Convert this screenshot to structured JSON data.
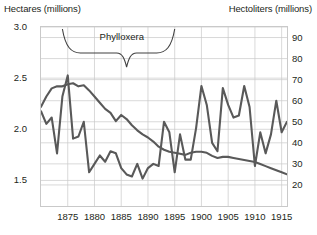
{
  "axis_titles": {
    "left": "Hectares (millions)",
    "right": "Hectoliters (millions)"
  },
  "annotation": {
    "label": "Phylloxera"
  },
  "colors": {
    "line": "#595959",
    "grid": "#c9c9c9",
    "frame": "#c9c9c9",
    "text": "#231f20",
    "brace": "#404040",
    "background": "#ffffff"
  },
  "chart_data": {
    "type": "line",
    "title": "",
    "subtitle": "",
    "xlabel": "",
    "ylabel": "Hectares (millions)",
    "y2label": "Hectoliters (millions)",
    "grid": true,
    "legend": "none",
    "xlim": [
      1870,
      1916
    ],
    "ylim": [
      1.25,
      3.0
    ],
    "y2lim": [
      10,
      95
    ],
    "xticks": [
      1875,
      1880,
      1885,
      1890,
      1895,
      1900,
      1905,
      1910,
      1915
    ],
    "yticks": [
      1.5,
      2.0,
      2.5,
      3.0
    ],
    "y2ticks": [
      20,
      30,
      40,
      50,
      60,
      70,
      80,
      90
    ],
    "annotations": [
      {
        "text": "Phylloxera",
        "type": "brace",
        "x_start": 1874,
        "x_end": 1895,
        "x_point": 1886
      }
    ],
    "x": [
      1870,
      1871,
      1872,
      1873,
      1874,
      1875,
      1876,
      1877,
      1878,
      1879,
      1880,
      1881,
      1882,
      1883,
      1884,
      1885,
      1886,
      1887,
      1888,
      1889,
      1890,
      1891,
      1892,
      1893,
      1894,
      1895,
      1896,
      1897,
      1898,
      1899,
      1900,
      1901,
      1902,
      1903,
      1904,
      1905,
      1906,
      1907,
      1908,
      1909,
      1910,
      1911,
      1912,
      1913,
      1914,
      1915,
      1916
    ],
    "series": [
      {
        "name": "Hectares (millions)",
        "axis": "left",
        "units": "millions of hectares",
        "values": [
          2.22,
          2.32,
          2.4,
          2.42,
          2.42,
          2.44,
          2.45,
          2.42,
          2.43,
          2.38,
          2.32,
          2.26,
          2.2,
          2.16,
          2.08,
          2.14,
          2.1,
          2.04,
          1.99,
          1.95,
          1.92,
          1.88,
          1.83,
          1.8,
          1.78,
          1.77,
          1.76,
          1.75,
          1.77,
          1.78,
          1.78,
          1.77,
          1.74,
          1.72,
          1.73,
          1.73,
          1.72,
          1.71,
          1.7,
          1.69,
          1.68,
          1.66,
          1.64,
          1.62,
          1.6,
          1.58,
          1.56
        ]
      },
      {
        "name": "Hectoliters (millions)",
        "axis": "right",
        "units": "millions of hectoliters",
        "values": [
          55,
          49,
          52,
          35,
          62,
          72,
          42,
          43,
          50,
          26,
          30,
          34,
          31,
          36,
          35,
          28,
          25,
          24,
          30,
          23,
          28,
          30,
          29,
          50,
          45,
          26,
          44,
          32,
          32,
          47,
          67,
          58,
          40,
          36,
          66,
          58,
          52,
          53,
          67,
          57,
          29,
          45,
          35,
          44,
          60,
          45,
          50
        ]
      }
    ]
  }
}
